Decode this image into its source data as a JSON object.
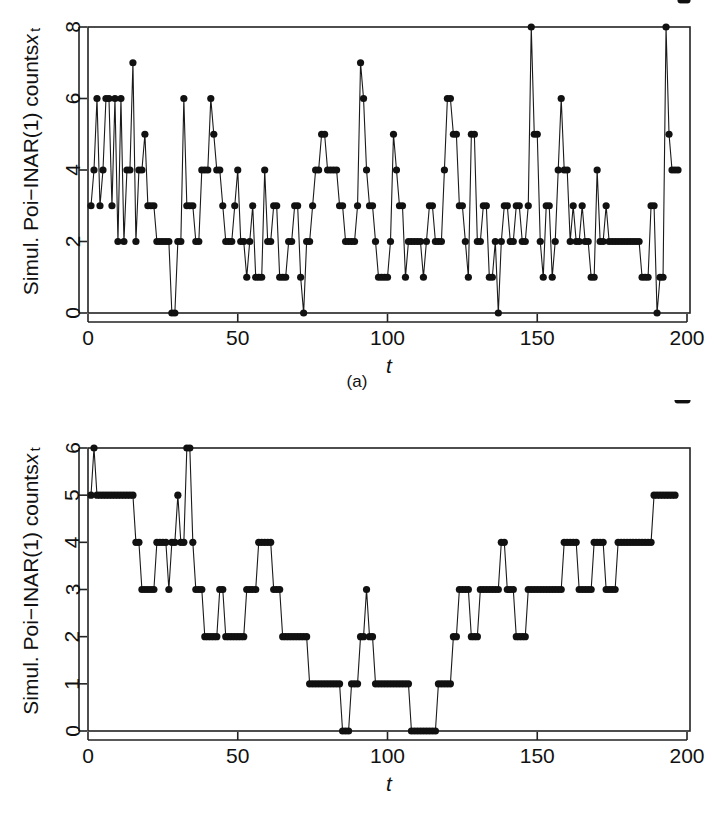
{
  "figure": {
    "panels": [
      {
        "id": "a",
        "caption": "(a)",
        "ylabel_main": "Simul. Poi−INAR(1) counts ",
        "ylabel_var": "x",
        "ylabel_sub": "t",
        "xlabel": "t"
      },
      {
        "id": "b",
        "caption": "(b)",
        "ylabel_main": "Simul. Poi−INAR(1) counts ",
        "ylabel_var": "x",
        "ylabel_sub": "t",
        "xlabel": "t"
      }
    ]
  },
  "chart_data": [
    {
      "type": "line",
      "id": "a",
      "title": "",
      "xlabel": "t",
      "ylabel": "Simul. Poi-INAR(1) counts x_t",
      "xlim": [
        0,
        201
      ],
      "ylim": [
        0,
        8
      ],
      "xticks": [
        0,
        50,
        100,
        150,
        200
      ],
      "yticks": [
        0,
        2,
        4,
        6,
        8
      ],
      "grid": false,
      "legend": false,
      "marker": "filled-circle",
      "x": [
        1,
        2,
        3,
        4,
        5,
        6,
        7,
        8,
        9,
        10,
        11,
        12,
        13,
        14,
        15,
        16,
        17,
        18,
        19,
        20,
        21,
        22,
        23,
        24,
        25,
        26,
        27,
        28,
        29,
        30,
        31,
        32,
        33,
        34,
        35,
        36,
        37,
        38,
        39,
        40,
        41,
        42,
        43,
        44,
        45,
        46,
        47,
        48,
        49,
        50,
        51,
        52,
        53,
        54,
        55,
        56,
        57,
        58,
        59,
        60,
        61,
        62,
        63,
        64,
        65,
        66,
        67,
        68,
        69,
        70,
        71,
        72,
        73,
        74,
        75,
        76,
        77,
        78,
        79,
        80,
        81,
        82,
        83,
        84,
        85,
        86,
        87,
        88,
        89,
        90,
        91,
        92,
        93,
        94,
        95,
        96,
        97,
        98,
        99,
        100,
        101,
        102,
        103,
        104,
        105,
        106,
        107,
        108,
        109,
        110,
        111,
        112,
        113,
        114,
        115,
        116,
        117,
        118,
        119,
        120,
        121,
        122,
        123,
        124,
        125,
        126,
        127,
        128,
        129,
        130,
        131,
        132,
        133,
        134,
        135,
        136,
        137,
        138,
        139,
        140,
        141,
        142,
        143,
        144,
        145,
        146,
        147,
        148,
        149,
        150,
        151,
        152,
        153,
        154,
        155,
        156,
        157,
        158,
        159,
        160,
        161,
        162,
        163,
        164,
        165,
        166,
        167,
        168,
        169,
        170,
        171,
        172,
        173,
        174,
        175,
        176,
        177,
        178,
        179,
        180,
        181,
        182,
        183,
        184,
        185,
        186,
        187,
        188,
        189,
        190,
        191,
        192,
        193,
        194,
        195,
        196,
        197,
        198,
        199,
        200
      ],
      "values": [
        3,
        4,
        6,
        3,
        4,
        6,
        6,
        3,
        6,
        2,
        6,
        2,
        4,
        4,
        7,
        2,
        4,
        4,
        5,
        3,
        3,
        3,
        2,
        2,
        2,
        2,
        2,
        0,
        0,
        2,
        2,
        6,
        3,
        3,
        3,
        2,
        2,
        4,
        4,
        4,
        6,
        5,
        4,
        4,
        3,
        2,
        2,
        2,
        3,
        4,
        2,
        2,
        1,
        2,
        3,
        1,
        1,
        1,
        4,
        2,
        2,
        3,
        3,
        1,
        1,
        1,
        2,
        2,
        3,
        3,
        1,
        0,
        2,
        2,
        3,
        4,
        4,
        5,
        5,
        4,
        4,
        4,
        4,
        3,
        3,
        2,
        2,
        2,
        2,
        3,
        7,
        6,
        4,
        3,
        3,
        2,
        1,
        1,
        1,
        1,
        2,
        5,
        4,
        3,
        3,
        1,
        2,
        2,
        2,
        2,
        2,
        1,
        2,
        3,
        3,
        2,
        2,
        2,
        4,
        6,
        6,
        5,
        5,
        3,
        3,
        2,
        1,
        5,
        5,
        2,
        2,
        3,
        3,
        1,
        1,
        2,
        0,
        2,
        3,
        3,
        2,
        2,
        3,
        3,
        2,
        2,
        3,
        8,
        5,
        5,
        2,
        1,
        3,
        3,
        1,
        2,
        4,
        6,
        4,
        4,
        2,
        3,
        2,
        2,
        3,
        2,
        2,
        1,
        1,
        4,
        2,
        2,
        3,
        2,
        2,
        2,
        2,
        2,
        2,
        2,
        2,
        2,
        2,
        2,
        1,
        1,
        1,
        3,
        3,
        0,
        1,
        1,
        8,
        5,
        4,
        4,
        4
      ]
    },
    {
      "type": "line",
      "id": "b",
      "title": "",
      "xlabel": "t",
      "ylabel": "Simul. Poi-INAR(1) counts x_t",
      "xlim": [
        0,
        201
      ],
      "ylim": [
        0,
        6
      ],
      "xticks": [
        0,
        50,
        100,
        150,
        200
      ],
      "yticks": [
        0,
        1,
        2,
        3,
        4,
        5,
        6
      ],
      "grid": false,
      "legend": false,
      "marker": "filled-circle",
      "x": [
        1,
        2,
        3,
        4,
        5,
        6,
        7,
        8,
        9,
        10,
        11,
        12,
        13,
        14,
        15,
        16,
        17,
        18,
        19,
        20,
        21,
        22,
        23,
        24,
        25,
        26,
        27,
        28,
        29,
        30,
        31,
        32,
        33,
        34,
        35,
        36,
        37,
        38,
        39,
        40,
        41,
        42,
        43,
        44,
        45,
        46,
        47,
        48,
        49,
        50,
        51,
        52,
        53,
        54,
        55,
        56,
        57,
        58,
        59,
        60,
        61,
        62,
        63,
        64,
        65,
        66,
        67,
        68,
        69,
        70,
        71,
        72,
        73,
        74,
        75,
        76,
        77,
        78,
        79,
        80,
        81,
        82,
        83,
        84,
        85,
        86,
        87,
        88,
        89,
        90,
        91,
        92,
        93,
        94,
        95,
        96,
        97,
        98,
        99,
        100,
        101,
        102,
        103,
        104,
        105,
        106,
        107,
        108,
        109,
        110,
        111,
        112,
        113,
        114,
        115,
        116,
        117,
        118,
        119,
        120,
        121,
        122,
        123,
        124,
        125,
        126,
        127,
        128,
        129,
        130,
        131,
        132,
        133,
        134,
        135,
        136,
        137,
        138,
        139,
        140,
        141,
        142,
        143,
        144,
        145,
        146,
        147,
        148,
        149,
        150,
        151,
        152,
        153,
        154,
        155,
        156,
        157,
        158,
        159,
        160,
        161,
        162,
        163,
        164,
        165,
        166,
        167,
        168,
        169,
        170,
        171,
        172,
        173,
        174,
        175,
        176,
        177,
        178,
        179,
        180,
        181,
        182,
        183,
        184,
        185,
        186,
        187,
        188,
        189,
        190,
        191,
        192,
        193,
        194,
        195,
        196,
        197,
        198,
        199,
        200
      ],
      "values": [
        5,
        6,
        5,
        5,
        5,
        5,
        5,
        5,
        5,
        5,
        5,
        5,
        5,
        5,
        5,
        4,
        4,
        3,
        3,
        3,
        3,
        3,
        4,
        4,
        4,
        4,
        3,
        4,
        4,
        5,
        4,
        4,
        6,
        6,
        4,
        3,
        3,
        3,
        2,
        2,
        2,
        2,
        2,
        3,
        3,
        2,
        2,
        2,
        2,
        2,
        2,
        2,
        3,
        3,
        3,
        3,
        4,
        4,
        4,
        4,
        4,
        3,
        3,
        3,
        2,
        2,
        2,
        2,
        2,
        2,
        2,
        2,
        2,
        1,
        1,
        1,
        1,
        1,
        1,
        1,
        1,
        1,
        1,
        1,
        0,
        0,
        0,
        1,
        1,
        1,
        2,
        2,
        3,
        2,
        2,
        1,
        1,
        1,
        1,
        1,
        1,
        1,
        1,
        1,
        1,
        1,
        1,
        0,
        0,
        0,
        0,
        0,
        0,
        0,
        0,
        0,
        1,
        1,
        1,
        1,
        1,
        2,
        2,
        3,
        3,
        3,
        3,
        2,
        2,
        2,
        3,
        3,
        3,
        3,
        3,
        3,
        3,
        4,
        4,
        3,
        3,
        3,
        2,
        2,
        2,
        2,
        3,
        3,
        3,
        3,
        3,
        3,
        3,
        3,
        3,
        3,
        3,
        3,
        4,
        4,
        4,
        4,
        4,
        3,
        3,
        3,
        3,
        3,
        4,
        4,
        4,
        4,
        3,
        3,
        3,
        3,
        4,
        4,
        4,
        4,
        4,
        4,
        4,
        4,
        4,
        4,
        4,
        4,
        5,
        5,
        5,
        5,
        5,
        5,
        5,
        5
      ]
    }
  ]
}
